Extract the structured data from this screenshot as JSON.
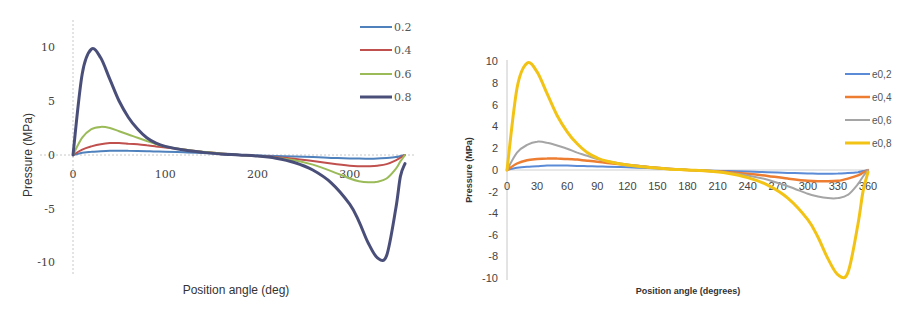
{
  "chart_data": [
    {
      "type": "line",
      "title": "",
      "xlabel": "Position angle (deg)",
      "ylabel": "Pressure (MPa)",
      "xlim": [
        0,
        360
      ],
      "ylim": [
        -10,
        10
      ],
      "x_ticks": [
        "0",
        "100",
        "200",
        "300"
      ],
      "y_ticks": [
        "10",
        "5",
        "0",
        "-5",
        "-10"
      ],
      "grid": false,
      "legend_position": "top-right",
      "x": [
        0,
        10,
        20,
        30,
        40,
        50,
        60,
        70,
        80,
        90,
        100,
        120,
        140,
        160,
        180,
        200,
        220,
        240,
        260,
        280,
        300,
        310,
        320,
        330,
        340,
        350,
        355,
        360
      ],
      "series": [
        {
          "name": "0.2",
          "color": "#4f81bd",
          "values": [
            0,
            0.2,
            0.3,
            0.35,
            0.4,
            0.4,
            0.4,
            0.38,
            0.35,
            0.32,
            0.3,
            0.25,
            0.18,
            0.1,
            0.02,
            -0.05,
            -0.1,
            -0.15,
            -0.2,
            -0.27,
            -0.32,
            -0.34,
            -0.35,
            -0.33,
            -0.28,
            -0.2,
            -0.1,
            0
          ]
        },
        {
          "name": "0.4",
          "color": "#c0504d",
          "values": [
            0,
            0.5,
            0.8,
            1.0,
            1.1,
            1.1,
            1.05,
            1.0,
            0.9,
            0.8,
            0.7,
            0.5,
            0.3,
            0.15,
            0.0,
            -0.1,
            -0.2,
            -0.35,
            -0.55,
            -0.8,
            -1.0,
            -1.05,
            -1.05,
            -1.0,
            -0.85,
            -0.5,
            -0.25,
            0
          ]
        },
        {
          "name": "0.6",
          "color": "#9bbb59",
          "values": [
            0,
            1.6,
            2.4,
            2.6,
            2.5,
            2.2,
            1.9,
            1.6,
            1.3,
            1.0,
            0.8,
            0.5,
            0.3,
            0.15,
            0.0,
            -0.1,
            -0.25,
            -0.5,
            -0.9,
            -1.5,
            -2.2,
            -2.45,
            -2.55,
            -2.5,
            -2.2,
            -1.3,
            -0.6,
            0
          ]
        },
        {
          "name": "0.8",
          "color": "#4a4f7a",
          "values": [
            0,
            7.5,
            9.8,
            9.0,
            7.0,
            5.0,
            3.5,
            2.4,
            1.6,
            1.1,
            0.8,
            0.45,
            0.25,
            0.1,
            0.0,
            -0.1,
            -0.3,
            -0.7,
            -1.4,
            -2.6,
            -4.6,
            -6.2,
            -8.2,
            -9.6,
            -9.4,
            -5.0,
            -2.0,
            -0.8
          ]
        }
      ]
    },
    {
      "type": "line",
      "title": "",
      "xlabel": "Position angle (degrees)",
      "ylabel": "Pressure (MPa)",
      "xlim": [
        0,
        360
      ],
      "ylim": [
        -10,
        10
      ],
      "x_ticks": [
        "0",
        "30",
        "60",
        "90",
        "120",
        "150",
        "180",
        "210",
        "240",
        "270",
        "300",
        "330",
        "360"
      ],
      "y_ticks": [
        "10",
        "8",
        "6",
        "4",
        "2",
        "0",
        "-2",
        "-4",
        "-6",
        "-8",
        "-10"
      ],
      "grid": false,
      "legend_position": "right",
      "x": [
        0,
        10,
        20,
        30,
        40,
        50,
        60,
        70,
        80,
        90,
        100,
        120,
        140,
        160,
        180,
        200,
        220,
        240,
        260,
        280,
        300,
        310,
        320,
        330,
        340,
        350,
        355,
        360
      ],
      "series": [
        {
          "name": "e0,2",
          "color": "#5b8bd6",
          "values": [
            0,
            0.2,
            0.3,
            0.35,
            0.4,
            0.4,
            0.4,
            0.38,
            0.35,
            0.32,
            0.3,
            0.25,
            0.18,
            0.1,
            0.02,
            -0.05,
            -0.1,
            -0.15,
            -0.2,
            -0.27,
            -0.32,
            -0.34,
            -0.35,
            -0.33,
            -0.28,
            -0.2,
            -0.1,
            0
          ]
        },
        {
          "name": "e0,4",
          "color": "#ed7d31",
          "values": [
            0,
            0.6,
            0.9,
            1.0,
            1.05,
            1.05,
            1.0,
            0.95,
            0.85,
            0.75,
            0.65,
            0.45,
            0.28,
            0.12,
            0.0,
            -0.1,
            -0.2,
            -0.35,
            -0.55,
            -0.8,
            -1.0,
            -1.05,
            -1.05,
            -1.0,
            -0.8,
            -0.5,
            -0.25,
            0
          ]
        },
        {
          "name": "e0,6",
          "color": "#a5a5a5",
          "values": [
            0,
            1.6,
            2.3,
            2.6,
            2.5,
            2.25,
            1.95,
            1.6,
            1.3,
            1.0,
            0.8,
            0.5,
            0.3,
            0.15,
            0.0,
            -0.1,
            -0.25,
            -0.5,
            -0.9,
            -1.5,
            -2.2,
            -2.45,
            -2.6,
            -2.6,
            -2.3,
            -1.3,
            -0.6,
            0
          ]
        },
        {
          "name": "e0,8",
          "color": "#f2c314",
          "values": [
            0,
            7.5,
            9.8,
            9.0,
            7.0,
            5.0,
            3.5,
            2.4,
            1.6,
            1.1,
            0.8,
            0.45,
            0.25,
            0.1,
            0.0,
            -0.1,
            -0.3,
            -0.7,
            -1.4,
            -2.6,
            -4.6,
            -6.2,
            -8.2,
            -9.7,
            -9.5,
            -5.0,
            -2.0,
            -0.2
          ]
        }
      ]
    }
  ]
}
